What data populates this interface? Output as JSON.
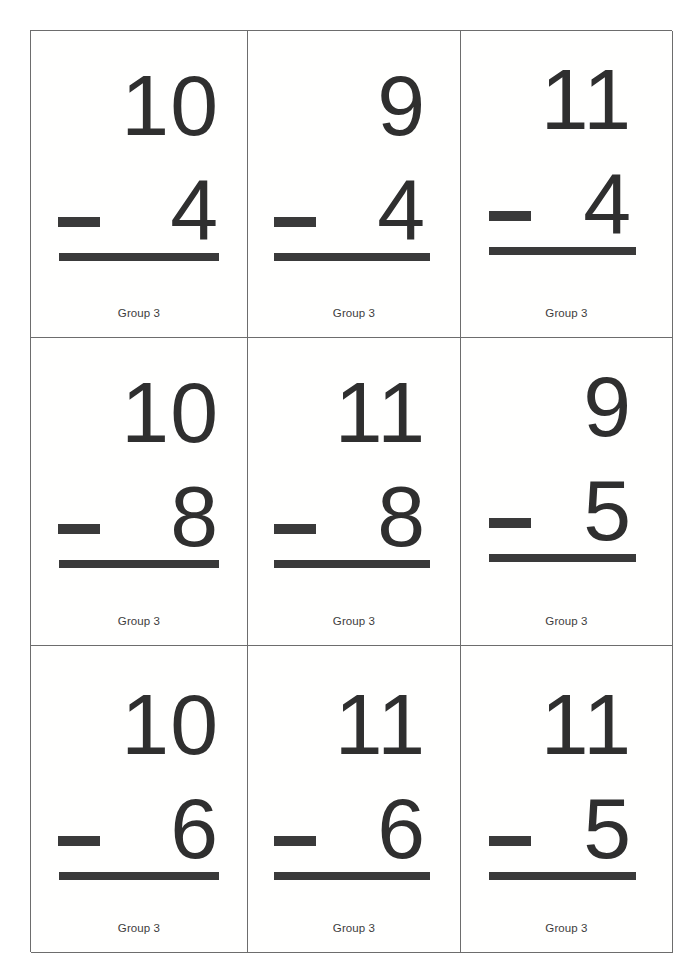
{
  "page": {
    "background_color": "#ffffff",
    "grid_line_color": "#6d6d6d",
    "ink_color": "#2f2f2f",
    "rule_color": "#3a3a3a",
    "columns": 3,
    "rows": 3
  },
  "cards": [
    {
      "id": "card-1",
      "minuend": "10",
      "operator": "−",
      "operator_name": "minus-sign",
      "subtrahend": "4",
      "label": "Group 3",
      "expression": "10 − 4"
    },
    {
      "id": "card-2",
      "minuend": "9",
      "operator": "−",
      "operator_name": "minus-sign",
      "subtrahend": "4",
      "label": "Group 3",
      "expression": "9 − 4"
    },
    {
      "id": "card-3",
      "minuend": "11",
      "operator": "−",
      "operator_name": "minus-sign",
      "subtrahend": "4",
      "label": "Group 3",
      "expression": "11 − 4"
    },
    {
      "id": "card-4",
      "minuend": "10",
      "operator": "−",
      "operator_name": "minus-sign",
      "subtrahend": "8",
      "label": "Group 3",
      "expression": "10 − 8"
    },
    {
      "id": "card-5",
      "minuend": "11",
      "operator": "−",
      "operator_name": "minus-sign",
      "subtrahend": "8",
      "label": "Group 3",
      "expression": "11 − 8"
    },
    {
      "id": "card-6",
      "minuend": "9",
      "operator": "−",
      "operator_name": "minus-sign",
      "subtrahend": "5",
      "label": "Group 3",
      "expression": "9 − 5"
    },
    {
      "id": "card-7",
      "minuend": "10",
      "operator": "−",
      "operator_name": "minus-sign",
      "subtrahend": "6",
      "label": "Group 3",
      "expression": "10 − 6"
    },
    {
      "id": "card-8",
      "minuend": "11",
      "operator": "−",
      "operator_name": "minus-sign",
      "subtrahend": "6",
      "label": "Group 3",
      "expression": "11 − 6"
    },
    {
      "id": "card-9",
      "minuend": "11",
      "operator": "−",
      "operator_name": "minus-sign",
      "subtrahend": "5",
      "label": "Group 3",
      "expression": "11 − 5"
    }
  ]
}
